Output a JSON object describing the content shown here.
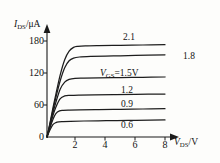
{
  "chart_data": {
    "type": "line",
    "title": "",
    "subtitle": "",
    "xlabel": "V_DS/V",
    "ylabel": "I_DS/uA",
    "xlabel_main": "V",
    "xlabel_sub": "DS",
    "xlabel_unit": "/V",
    "ylabel_main": "I",
    "ylabel_sub": "DS",
    "ylabel_unit": "/μA",
    "xlim": [
      0,
      8.6
    ],
    "ylim": [
      0,
      195
    ],
    "grid": false,
    "legend_position": "inline-right",
    "xticks": [
      "0",
      "2",
      "4",
      "6",
      "8"
    ],
    "xtick_values": [
      0,
      2,
      4,
      6,
      8
    ],
    "yticks": [
      "0",
      "60",
      "120",
      "180"
    ],
    "ytick_values": [
      0,
      60,
      120,
      180
    ],
    "annotations": [
      {
        "text": "V_GS=1.5V",
        "prefix": "V",
        "sub": "GS",
        "suffix": "=1.5V",
        "series": "1.5"
      }
    ],
    "series": [
      {
        "name": "2.1",
        "label": "2.1",
        "vgs": 2.1,
        "saturation_current": 172,
        "knee_voltage": 1.9,
        "x": [
          0,
          0.2,
          0.4,
          0.6,
          0.9,
          1.2,
          1.5,
          1.8,
          2.1,
          2.6,
          3.5,
          5.0,
          6.5,
          8.0
        ],
        "values": [
          0,
          26,
          54,
          80,
          117,
          145,
          161,
          168,
          170,
          171,
          171.5,
          172,
          172.5,
          173
        ]
      },
      {
        "name": "1.8",
        "label": "1.8",
        "vgs": 1.8,
        "saturation_current": 152,
        "knee_voltage": 1.7,
        "x": [
          0,
          0.2,
          0.4,
          0.6,
          0.9,
          1.2,
          1.5,
          1.8,
          2.2,
          3.0,
          4.5,
          6.0,
          8.0
        ],
        "values": [
          0,
          24,
          50,
          74,
          106,
          130,
          143,
          148,
          150,
          151,
          152,
          153,
          154
        ]
      },
      {
        "name": "1.5",
        "label": "1.5",
        "vgs": 1.5,
        "saturation_current": 110,
        "knee_voltage": 1.4,
        "x": [
          0,
          0.2,
          0.4,
          0.6,
          0.9,
          1.2,
          1.5,
          1.9,
          2.5,
          3.5,
          5.0,
          6.5,
          8.0
        ],
        "values": [
          0,
          22,
          45,
          65,
          90,
          103,
          108,
          110,
          110.5,
          111,
          111.5,
          112,
          112.5
        ]
      },
      {
        "name": "1.2",
        "label": "1.2",
        "vgs": 1.2,
        "saturation_current": 78,
        "knee_voltage": 1.2,
        "x": [
          0,
          0.2,
          0.4,
          0.6,
          0.9,
          1.2,
          1.6,
          2.2,
          3.2,
          4.5,
          6.0,
          8.0
        ],
        "values": [
          0,
          20,
          40,
          56,
          72,
          77,
          78,
          78.5,
          79,
          79.5,
          80,
          80.5
        ]
      },
      {
        "name": "0.9",
        "label": "0.9",
        "vgs": 0.9,
        "saturation_current": 50,
        "knee_voltage": 1.0,
        "x": [
          0,
          0.2,
          0.4,
          0.6,
          0.85,
          1.1,
          1.5,
          2.2,
          3.5,
          5.0,
          6.5,
          8.0
        ],
        "values": [
          0,
          17,
          33,
          44,
          49,
          50,
          50.5,
          51,
          51.5,
          52,
          52.5,
          53
        ]
      },
      {
        "name": "0.6",
        "label": "0.6",
        "vgs": 0.6,
        "saturation_current": 29,
        "knee_voltage": 0.8,
        "x": [
          0,
          0.2,
          0.4,
          0.6,
          0.8,
          1.1,
          1.6,
          2.5,
          4.0,
          5.5,
          7.0,
          8.0
        ],
        "values": [
          0,
          13,
          23,
          27,
          28.5,
          29,
          29.5,
          30,
          30.5,
          31,
          31.5,
          32
        ]
      }
    ]
  },
  "axis": {
    "y_title_main": "I",
    "y_title_sub": "DS",
    "y_title_unit": "/μA",
    "x_title_main": "V",
    "x_title_sub": "DS",
    "x_title_unit": "/V"
  },
  "ticks": {
    "y": {
      "t180": "180",
      "t120": "120",
      "t60": "60",
      "t0": "0"
    },
    "x": {
      "t2": "2",
      "t4": "4",
      "t6": "6",
      "t8": "8"
    }
  },
  "curve_labels": {
    "l21": "2.1",
    "l18": "1.8",
    "l15_prefix": "V",
    "l15_sub": "GS",
    "l15_suffix": "=1.5V",
    "l12": "1.2",
    "l09": "0.9",
    "l06": "0.6"
  },
  "colors": {
    "background": "#fdfdfb",
    "ink": "#1b1b1b",
    "curve": "#1d1d1d"
  }
}
